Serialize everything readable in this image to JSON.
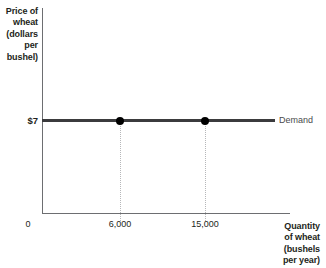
{
  "chart_data": {
    "type": "line",
    "title": "",
    "xlabel": "Quantity of wheat (bushels per year)",
    "ylabel": "Price of wheat (dollars per bushel)",
    "legend_position": "right-of-line",
    "grid": false,
    "xlim": [
      0,
      22000
    ],
    "ylim": [
      0,
      13
    ],
    "x_tick_labels": [
      "6,000",
      "15,000"
    ],
    "x_tick_values": [
      6000,
      15000
    ],
    "y_tick_labels": [
      "$7"
    ],
    "y_tick_values": [
      7
    ],
    "origin_label": "0",
    "series": [
      {
        "name": "Demand",
        "label": "Demand",
        "type": "horizontal-line",
        "y_value": 7,
        "x_start": 0,
        "x_end": 20500,
        "points": [
          {
            "x": 6000,
            "y": 7,
            "x_label": "6,000",
            "y_label": "$7"
          },
          {
            "x": 15000,
            "y": 7,
            "x_label": "15,000",
            "y_label": "$7"
          }
        ]
      }
    ],
    "annotations": [
      {
        "name": "drop-line",
        "x": 6000,
        "from_y": 7,
        "to_y": 0,
        "style": "dotted"
      },
      {
        "name": "drop-line",
        "x": 15000,
        "from_y": 7,
        "to_y": 0,
        "style": "dotted"
      }
    ],
    "colors": {
      "demand_line": "#3b3b3d",
      "data_point": "#000000",
      "axis": "#6d6e71",
      "drop_line": "#b6b7b9",
      "text": "#231f20",
      "label_text": "#4a4a4c"
    }
  },
  "axes": {
    "y_title": "Price of\nwheat\n(dollars\nper\nbushel)",
    "x_title": "Quantity\nof wheat\n(bushels\nper year)",
    "origin": "0"
  },
  "ticks": {
    "y": {
      "price": "$7"
    },
    "x": {
      "first": "6,000",
      "second": "15,000"
    }
  },
  "curve": {
    "demand_label": "Demand"
  }
}
